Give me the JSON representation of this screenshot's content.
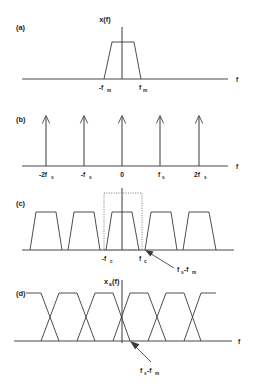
{
  "figure": {
    "background_color": "#ffffff",
    "line_color": "#3a3a3a",
    "text_color": "#1c1c1c"
  },
  "panels": [
    {
      "id": "a",
      "label": "(a)",
      "title": "x(f)",
      "axis_label": "f",
      "type": "baseband-spectrum",
      "tick_labels": [
        {
          "main": "-f",
          "sub": "m"
        },
        {
          "main": "f",
          "sub": "m"
        }
      ]
    },
    {
      "id": "b",
      "label": "(b)",
      "title": "",
      "axis_label": "f",
      "type": "impulse-train",
      "tick_labels": [
        {
          "main": "-2f",
          "sub": "s"
        },
        {
          "main": "-f",
          "sub": "s"
        },
        {
          "main": "0",
          "sub": ""
        },
        {
          "main": "f",
          "sub": "s"
        },
        {
          "main": "2f",
          "sub": "s"
        }
      ]
    },
    {
      "id": "c",
      "label": "(c)",
      "title": "",
      "axis_label": "",
      "type": "sampled-spectrum-no-overlap",
      "tick_labels": [
        {
          "main": "-f",
          "sub": "c"
        },
        {
          "main": "f",
          "sub": "c"
        }
      ],
      "annotation": {
        "main1": "f",
        "sub1": "s",
        "main2": "-f",
        "sub2": "m"
      }
    },
    {
      "id": "d",
      "label": "(d)",
      "title_main": "x",
      "title_sub": "a",
      "title_tail": "(f)",
      "axis_label": "f",
      "type": "sampled-spectrum-aliased",
      "tick_labels": [],
      "annotation": {
        "main1": "f",
        "sub1": "s",
        "main2": "-f",
        "sub2": "m"
      }
    }
  ]
}
